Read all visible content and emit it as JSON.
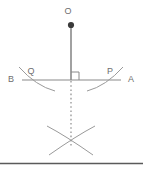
{
  "figure": {
    "type": "geometry-construction-diagram",
    "background_color": "#ffffff",
    "stroke_color": "#8a8a8a",
    "label_color": "#6e6e6e",
    "point_fill_color": "#3a3a3a",
    "rule_color": "#5a5a5a",
    "labels": {
      "o": "O",
      "b": "B",
      "q": "Q",
      "p": "P",
      "a": "A"
    },
    "elements": {
      "point_o": "point-o-dot",
      "segment_oi": "vertical-segment-o-to-intersection",
      "line_ba": "horizontal-line-b-to-a",
      "right_angle": "right-angle-marker",
      "arc_q": "compass-arc-left-through-q",
      "arc_p": "compass-arc-right-through-p",
      "dotted_line": "dotted-vertical-extension",
      "arc_lower_left": "compass-arc-lower-left",
      "arc_lower_right": "compass-arc-lower-right",
      "bottom_rule": "bottom-horizontal-rule"
    },
    "geometry": {
      "point_o_x": 71,
      "point_o_y": 24,
      "intersection_x": 71,
      "intersection_y": 80,
      "line_left_x": 22,
      "line_right_x": 121,
      "arc_crossing_x": 71,
      "arc_crossing_y": 140,
      "bottom_rule_y": 163
    }
  }
}
